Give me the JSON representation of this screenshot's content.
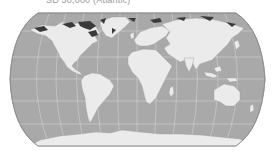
{
  "title": "SD 50,000 (Atlantic)",
  "map": {
    "projection": "pseudocylindrical world (Equal Earth / Robinson style)",
    "colors": {
      "background": "#ffffff",
      "ocean": "#a9a9a9",
      "land": "#ebebeb",
      "deep_highlight": "#3a3a3a",
      "graticule": "#d6d6d6",
      "outline": "#8a8a8a"
    },
    "features": [
      {
        "name": "North America"
      },
      {
        "name": "South America"
      },
      {
        "name": "Greenland"
      },
      {
        "name": "Europe"
      },
      {
        "name": "Africa"
      },
      {
        "name": "Asia"
      },
      {
        "name": "Australia"
      },
      {
        "name": "Antarctica"
      }
    ]
  }
}
